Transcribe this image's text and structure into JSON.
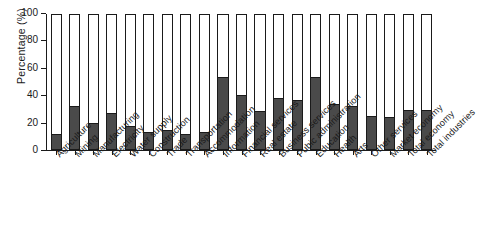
{
  "chart_data": {
    "type": "bar",
    "title": "",
    "xlabel": "",
    "ylabel": "Percentage (%)",
    "ylim": [
      0,
      100
    ],
    "yticks": [
      0,
      20,
      40,
      60,
      80,
      100
    ],
    "ytick_labels": [
      "0",
      "20",
      "40",
      "60",
      "80",
      "100"
    ],
    "grid": false,
    "legend": null,
    "legend_position": "none",
    "bar_style": "outlined-to-100-with-dark-filled-portion",
    "colors": {
      "fill": "#4a4a4a",
      "outline": "#1a1a1a",
      "background": "#ffffff",
      "text": "#1a1a1a"
    },
    "categories": [
      "Agriculture",
      "Mining",
      "Manufacturing",
      "Electricity",
      "Water supply",
      "Construction",
      "Trade",
      "Transportation",
      "Accommodation",
      "Information",
      "Financial services",
      "Real estate",
      "Business services",
      "Pubic administration",
      "Education",
      "Health",
      "Arts",
      "Other services",
      "Market economy",
      "Total economy",
      "Total industries"
    ],
    "series": [
      {
        "name": "Percentage",
        "values": [
          12,
          32.5,
          19.5,
          27,
          18,
          13.5,
          14.5,
          12,
          13.5,
          54,
          40.5,
          28.5,
          38,
          36.5,
          54,
          34,
          32,
          25,
          24.5,
          29.5,
          29.5
        ]
      },
      {
        "name": "Remainder to 100",
        "values": [
          88,
          67.5,
          80.5,
          73,
          82,
          86.5,
          85.5,
          88,
          86.5,
          46,
          59.5,
          71.5,
          62,
          63.5,
          46,
          66,
          68,
          75,
          75.5,
          70.5,
          70.5
        ]
      }
    ]
  }
}
